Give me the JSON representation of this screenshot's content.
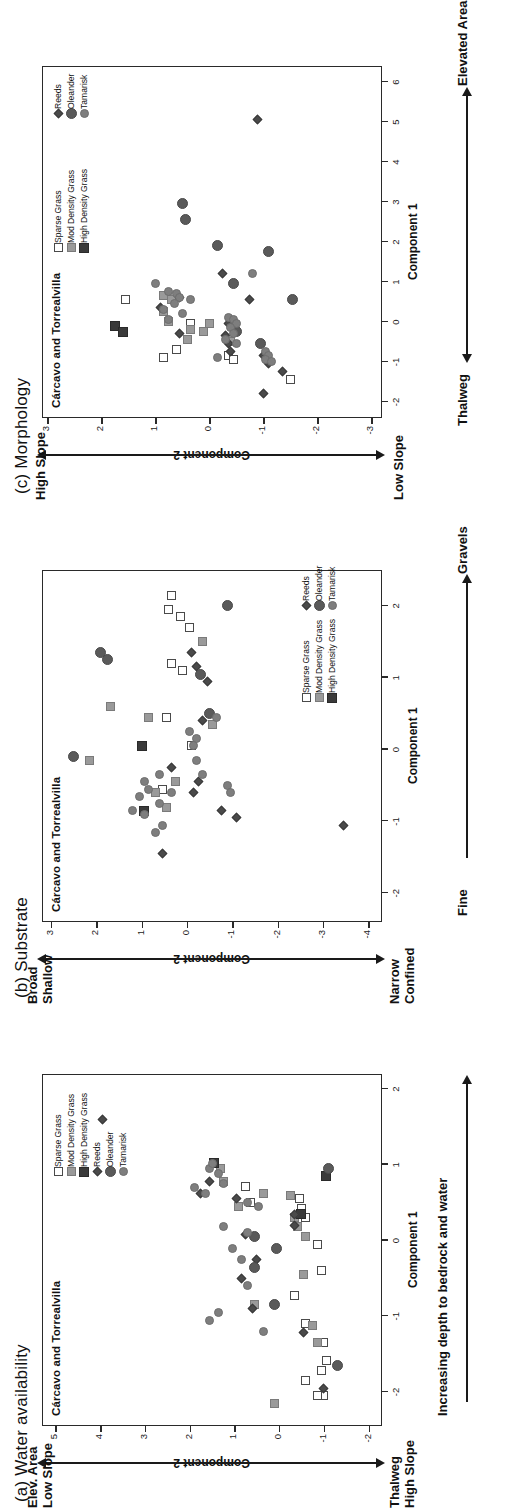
{
  "figure": {
    "orientation": "rotated-90-ccw",
    "site_label": "Cárcavo and Torrealvilla"
  },
  "colors": {
    "sparse_grass": "#ffffff",
    "mod_density_grass": "#9a9a9a",
    "high_density_grass": "#3a3a3a",
    "reeds": "#4a4a4a",
    "oleander": "#5a5a5a",
    "tamarisk": "#7e7e7e",
    "axis": "#2a2a2a",
    "text": "#111111"
  },
  "legend_labels": {
    "sparse_grass": "Sparse Grass",
    "mod_density_grass": "Mod Density Grass",
    "high_density_grass": "High Density Grass",
    "reeds": "Reeds",
    "oleander": "Oleander",
    "tamarisk": "Tamarisk"
  },
  "chart_data": [
    {
      "id": "panel-a",
      "type": "scatter",
      "title": "(a) Water availability",
      "inner_title": "Cárcavo and Torrealvilla",
      "xlabel": "Component 1",
      "ylabel": "Component 2",
      "xlim": [
        -2.45,
        2.2
      ],
      "ylim": [
        -2.3,
        5.3
      ],
      "xticks": [
        -2,
        -1,
        0,
        1,
        2
      ],
      "yticks": [
        5,
        4,
        3,
        2,
        1,
        0,
        -1,
        -2
      ],
      "xtick_labels": [
        "-2",
        "-1",
        "0",
        "1",
        "2"
      ],
      "ytick_labels": [
        "5",
        "4",
        "3",
        "2",
        "1",
        "0",
        "-1",
        "-2"
      ],
      "grid": false,
      "axis_arrow_label": "Increasing depth to bedrock and water",
      "y_axis_top_label": "Elev. Area\nLow Slope",
      "y_axis_bottom_label": "Thalweg\nHigh Slope",
      "legend_position": "top-right-inside",
      "legend_entries": [
        "Sparse Grass",
        "Mod Density Grass",
        "High Density Grass",
        "Reeds",
        "Oleander",
        "Tamarisk"
      ],
      "series": [
        {
          "name": "Sparse Grass",
          "points": [
            [
              -2.05,
              -1.0
            ],
            [
              -2.05,
              -0.85
            ],
            [
              -1.85,
              -0.6
            ],
            [
              -1.72,
              -0.95
            ],
            [
              -1.58,
              -1.05
            ],
            [
              -1.35,
              -1.0
            ],
            [
              -1.1,
              -0.6
            ],
            [
              -0.72,
              -0.35
            ],
            [
              -0.4,
              -0.95
            ],
            [
              -0.05,
              -0.85
            ],
            [
              0.3,
              -0.6
            ],
            [
              0.42,
              -0.5
            ],
            [
              0.5,
              0.65
            ],
            [
              0.56,
              -0.45
            ],
            [
              0.72,
              0.75
            ]
          ]
        },
        {
          "name": "Mod Density Grass",
          "points": [
            [
              -2.15,
              0.1
            ],
            [
              -1.35,
              -0.85
            ],
            [
              -1.12,
              -0.75
            ],
            [
              -0.85,
              0.55
            ],
            [
              -0.45,
              -0.55
            ],
            [
              0.05,
              -0.6
            ],
            [
              0.18,
              -0.4
            ],
            [
              0.3,
              -0.35
            ],
            [
              0.45,
              0.9
            ],
            [
              0.6,
              -0.25
            ],
            [
              0.62,
              0.35
            ],
            [
              0.78,
              1.25
            ],
            [
              0.95,
              1.3
            ]
          ]
        },
        {
          "name": "High Density Grass",
          "points": [
            [
              0.35,
              -0.5
            ],
            [
              0.85,
              -1.05
            ],
            [
              1.02,
              1.45
            ]
          ]
        },
        {
          "name": "Reeds",
          "points": [
            [
              -1.95,
              -1.0
            ],
            [
              -1.22,
              -0.55
            ],
            [
              -0.9,
              0.6
            ],
            [
              -0.5,
              0.85
            ],
            [
              -0.25,
              0.5
            ],
            [
              0.08,
              0.75
            ],
            [
              0.2,
              -0.35
            ],
            [
              0.35,
              -0.35
            ],
            [
              0.55,
              0.95
            ],
            [
              0.62,
              1.75
            ],
            [
              0.78,
              1.55
            ],
            [
              1.6,
              3.95
            ]
          ]
        },
        {
          "name": "Oleander",
          "points": [
            [
              -1.65,
              -1.3
            ],
            [
              -0.85,
              0.1
            ],
            [
              -0.35,
              0.55
            ],
            [
              -0.1,
              0.05
            ],
            [
              0.05,
              0.55
            ],
            [
              0.95,
              -1.1
            ]
          ]
        },
        {
          "name": "Tamarisk",
          "points": [
            [
              -1.2,
              0.35
            ],
            [
              -1.05,
              1.55
            ],
            [
              -0.95,
              1.35
            ],
            [
              -0.6,
              0.7
            ],
            [
              -0.25,
              0.85
            ],
            [
              -0.1,
              1.05
            ],
            [
              0.1,
              0.7
            ],
            [
              0.18,
              1.25
            ],
            [
              0.45,
              0.45
            ],
            [
              0.5,
              0.7
            ],
            [
              0.62,
              1.65
            ],
            [
              0.75,
              1.25
            ],
            [
              0.88,
              1.35
            ],
            [
              0.95,
              1.55
            ],
            [
              1.02,
              1.5
            ],
            [
              0.7,
              1.9
            ]
          ]
        }
      ]
    },
    {
      "id": "panel-b",
      "type": "scatter",
      "title": "(b) Substrate",
      "inner_title": "Cárcavo and Torrealvilla",
      "xlabel": "Component 1",
      "ylabel": "Component 2",
      "xlim": [
        -2.4,
        2.5
      ],
      "ylim": [
        -4.3,
        3.2
      ],
      "xticks": [
        -2,
        -1,
        0,
        1,
        2
      ],
      "yticks": [
        3,
        2,
        1,
        0,
        -1,
        -2,
        -3,
        -4
      ],
      "xtick_labels": [
        "-2",
        "-1",
        "0",
        "1",
        "2"
      ],
      "ytick_labels": [
        "3",
        "2",
        "1",
        "0",
        "-1",
        "-2",
        "-3",
        "-4"
      ],
      "grid": false,
      "x_axis_left_label": "Fine",
      "x_axis_right_label": "Gravels",
      "y_axis_top_label": "Broad\nShallow",
      "y_axis_bottom_label": "Narrow\nConfined",
      "legend_position": "bottom-right-inside",
      "legend_entries": [
        "Sparse Grass",
        "Mod Density Grass",
        "High Density Grass",
        "Reeds",
        "Oleander",
        "Tamarisk"
      ],
      "series": [
        {
          "name": "Sparse Grass",
          "points": [
            [
              2.15,
              0.35
            ],
            [
              1.95,
              0.4
            ],
            [
              1.85,
              0.15
            ],
            [
              1.7,
              -0.05
            ],
            [
              1.2,
              0.35
            ],
            [
              1.1,
              0.1
            ],
            [
              0.45,
              0.45
            ],
            [
              0.05,
              -0.1
            ],
            [
              -0.55,
              0.55
            ]
          ]
        },
        {
          "name": "Mod Density Grass",
          "points": [
            [
              1.5,
              -0.35
            ],
            [
              0.6,
              1.7
            ],
            [
              0.45,
              0.85
            ],
            [
              -0.15,
              2.15
            ],
            [
              -0.45,
              0.25
            ],
            [
              -0.6,
              0.7
            ],
            [
              -0.8,
              0.45
            ],
            [
              0.35,
              -0.55
            ]
          ]
        },
        {
          "name": "High Density Grass",
          "points": [
            [
              0.05,
              1.0
            ],
            [
              -0.85,
              0.95
            ]
          ]
        },
        {
          "name": "Reeds",
          "points": [
            [
              1.35,
              -0.1
            ],
            [
              1.15,
              -0.2
            ],
            [
              0.95,
              -0.45
            ],
            [
              0.4,
              -0.35
            ],
            [
              -0.25,
              0.35
            ],
            [
              -0.45,
              -0.25
            ],
            [
              -0.6,
              -0.15
            ],
            [
              -0.85,
              -0.75
            ],
            [
              -0.95,
              -1.1
            ],
            [
              -1.45,
              0.55
            ],
            [
              -1.05,
              -3.45
            ]
          ]
        },
        {
          "name": "Oleander",
          "points": [
            [
              2.0,
              -0.9
            ],
            [
              1.35,
              1.9
            ],
            [
              1.25,
              1.75
            ],
            [
              1.05,
              -0.3
            ],
            [
              0.5,
              -0.5
            ],
            [
              -0.1,
              2.5
            ]
          ]
        },
        {
          "name": "Tamarisk",
          "points": [
            [
              0.45,
              -0.65
            ],
            [
              0.25,
              -0.05
            ],
            [
              0.15,
              -0.2
            ],
            [
              0.05,
              -0.15
            ],
            [
              -0.15,
              -0.2
            ],
            [
              -0.35,
              0.6
            ],
            [
              -0.45,
              0.95
            ],
            [
              -0.55,
              0.85
            ],
            [
              -0.6,
              0.35
            ],
            [
              -0.65,
              1.05
            ],
            [
              -0.75,
              0.6
            ],
            [
              -0.85,
              1.2
            ],
            [
              -0.9,
              0.95
            ],
            [
              -1.05,
              0.55
            ],
            [
              -1.15,
              0.7
            ],
            [
              -0.5,
              -0.9
            ],
            [
              -0.6,
              -0.95
            ],
            [
              -0.35,
              -0.35
            ]
          ]
        }
      ]
    },
    {
      "id": "panel-c",
      "type": "scatter",
      "title": "(c) Morphology",
      "inner_title": "Cárcavo and Torrealvilla",
      "xlabel": "Component 1",
      "ylabel": "Component 2",
      "xlim": [
        -2.4,
        6.4
      ],
      "ylim": [
        -3.2,
        3.1
      ],
      "xticks": [
        -2,
        -1,
        0,
        1,
        2,
        3,
        4,
        5,
        6
      ],
      "yticks": [
        3,
        2,
        1,
        0,
        -1,
        -2,
        -3
      ],
      "xtick_labels": [
        "-2",
        "-1",
        "0",
        "1",
        "2",
        "3",
        "4",
        "5",
        "6"
      ],
      "ytick_labels": [
        "3",
        "2",
        "1",
        "0",
        "-1",
        "-2",
        "-3"
      ],
      "grid": false,
      "x_axis_left_label": "Thalweg",
      "x_axis_right_label": "Elevated Area",
      "y_axis_top_label": "High Slope",
      "y_axis_bottom_label": "Low Slope",
      "legend_position": "top-right-inside-two-groups",
      "legend_group_1": [
        "Sparse Grass",
        "Mod Density Grass",
        "High Density Grass"
      ],
      "legend_group_2": [
        "Reeds",
        "Oleander",
        "Tamarisk"
      ],
      "series": [
        {
          "name": "Sparse Grass",
          "points": [
            [
              0.55,
              1.55
            ],
            [
              -0.05,
              0.35
            ],
            [
              -0.7,
              0.6
            ],
            [
              -0.9,
              0.85
            ],
            [
              -0.85,
              -0.35
            ],
            [
              -1.45,
              -1.5
            ],
            [
              -0.95,
              -0.45
            ]
          ]
        },
        {
          "name": "Mod Density Grass",
          "points": [
            [
              0.65,
              0.85
            ],
            [
              0.55,
              0.7
            ],
            [
              0.25,
              0.85
            ],
            [
              0.0,
              0.75
            ],
            [
              -0.2,
              0.35
            ],
            [
              -0.45,
              0.4
            ],
            [
              -0.5,
              -0.4
            ],
            [
              -0.05,
              0.0
            ],
            [
              -0.25,
              0.1
            ]
          ]
        },
        {
          "name": "High Density Grass",
          "points": [
            [
              -0.1,
              1.75
            ],
            [
              -0.25,
              1.6
            ]
          ]
        },
        {
          "name": "Reeds",
          "points": [
            [
              1.2,
              -0.25
            ],
            [
              0.6,
              0.55
            ],
            [
              0.55,
              -0.75
            ],
            [
              0.35,
              0.9
            ],
            [
              -0.05,
              -0.35
            ],
            [
              -0.3,
              0.55
            ],
            [
              -0.35,
              -0.3
            ],
            [
              -0.55,
              -0.35
            ],
            [
              -0.75,
              -0.4
            ],
            [
              -0.85,
              -1.0
            ],
            [
              -1.05,
              -1.1
            ],
            [
              -1.25,
              -1.35
            ],
            [
              -1.8,
              -1.0
            ],
            [
              5.05,
              -0.9
            ]
          ]
        },
        {
          "name": "Oleander",
          "points": [
            [
              2.95,
              0.5
            ],
            [
              2.55,
              0.45
            ],
            [
              1.9,
              -0.15
            ],
            [
              1.75,
              -1.1
            ],
            [
              0.55,
              -1.55
            ],
            [
              -0.55,
              -0.95
            ],
            [
              -0.25,
              -0.5
            ],
            [
              0.95,
              -0.45
            ]
          ]
        },
        {
          "name": "Tamarisk",
          "points": [
            [
              0.95,
              1.0
            ],
            [
              0.75,
              0.75
            ],
            [
              0.7,
              0.6
            ],
            [
              0.6,
              0.55
            ],
            [
              0.55,
              0.35
            ],
            [
              0.45,
              0.65
            ],
            [
              0.3,
              0.85
            ],
            [
              0.2,
              0.5
            ],
            [
              0.1,
              -0.35
            ],
            [
              0.05,
              -0.45
            ],
            [
              -0.05,
              -0.5
            ],
            [
              -0.15,
              -0.4
            ],
            [
              -0.3,
              -0.45
            ],
            [
              -0.45,
              -0.3
            ],
            [
              -0.55,
              -0.5
            ],
            [
              -0.75,
              -1.05
            ],
            [
              -0.85,
              -1.1
            ],
            [
              -0.95,
              -1.05
            ],
            [
              -1.0,
              -1.15
            ],
            [
              1.2,
              -0.8
            ],
            [
              -0.9,
              -0.15
            ],
            [
              0.05,
              0.75
            ]
          ]
        }
      ]
    }
  ]
}
